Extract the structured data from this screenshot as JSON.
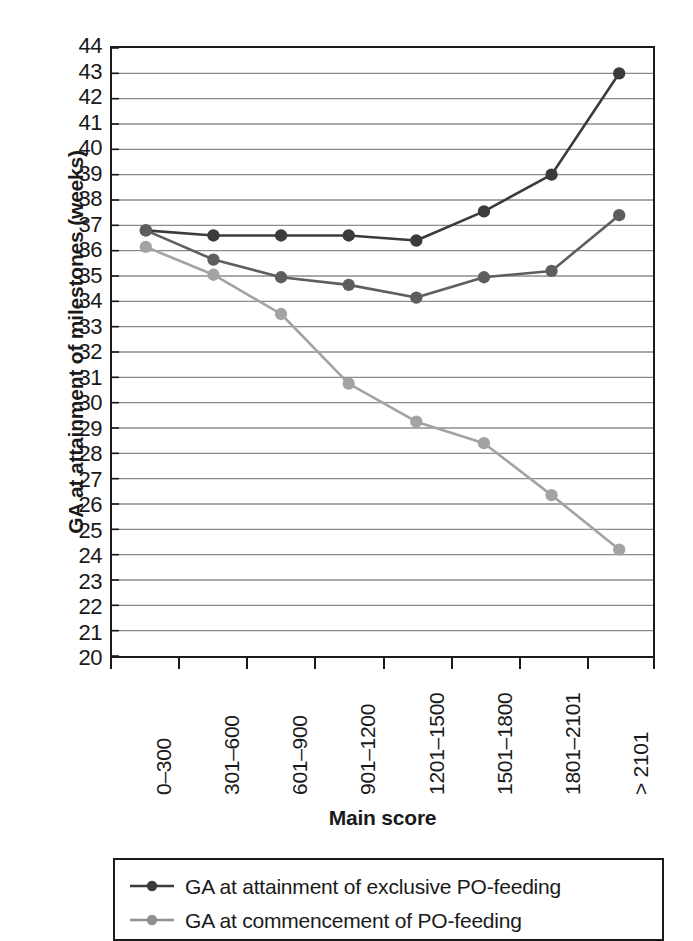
{
  "chart_data": {
    "type": "line",
    "title": "",
    "xlabel": "Main score",
    "ylabel": "GA at attainment of milestones (weeks)",
    "categories": [
      "0–300",
      "301–600",
      "601–900",
      "901–1200",
      "1201–1500",
      "1501–1800",
      "1801–2101",
      "> 2101"
    ],
    "ylim": [
      20,
      44
    ],
    "ytick_step": 1,
    "yticks": [
      44,
      43,
      42,
      41,
      40,
      39,
      38,
      37,
      36,
      35,
      34,
      33,
      32,
      31,
      30,
      29,
      28,
      27,
      26,
      25,
      24,
      23,
      22,
      21,
      20
    ],
    "grid": "horizontal",
    "legend_position": "below-plot",
    "series": [
      {
        "name": "GA at attainment of exclusive PO-feeding",
        "color": "#3b3b3b",
        "values": [
          36.8,
          36.6,
          36.6,
          36.6,
          36.4,
          37.55,
          39.0,
          43.0
        ]
      },
      {
        "name": "series-middle",
        "color": "#5e5e5e",
        "values": [
          36.8,
          35.65,
          34.95,
          34.65,
          34.15,
          34.95,
          35.2,
          37.4
        ]
      },
      {
        "name": "GA at commencement of PO-feeding",
        "color": "#a3a3a3",
        "values": [
          36.15,
          35.05,
          33.5,
          30.75,
          29.25,
          28.4,
          26.35,
          24.2
        ]
      }
    ]
  },
  "legend": {
    "entries": [
      {
        "label": "GA at attainment of exclusive PO-feeding",
        "color": "#3b3b3b"
      },
      {
        "label": "GA at commencement of PO-feeding",
        "color": "#8f8f8f"
      }
    ]
  },
  "colors": {
    "axis": "#1a1a1a",
    "grid": "#8c8c8c",
    "background": "#ffffff"
  }
}
